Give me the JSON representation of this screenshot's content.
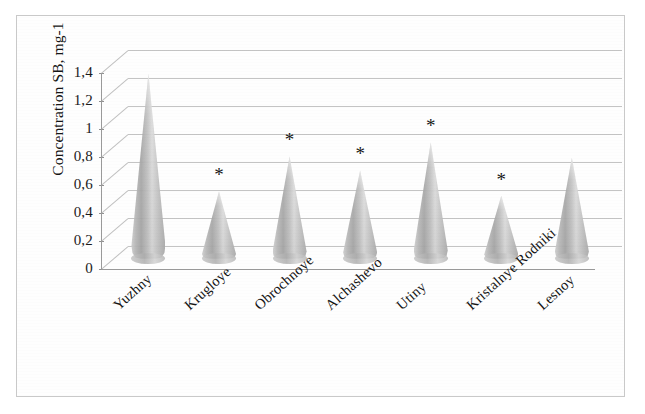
{
  "chart_data": {
    "type": "bar",
    "subtype": "3d-cone",
    "title": "",
    "xlabel": "",
    "ylabel": "Concentration SB, mg-1",
    "categories": [
      "Yuzhny",
      "Krugloye",
      "Obrochnoye",
      "Alchashevo",
      "Utiny",
      "Kristalnye Rodniki",
      "Lesnoy"
    ],
    "values": [
      1.32,
      0.48,
      0.73,
      0.63,
      0.83,
      0.45,
      0.72
    ],
    "annotations": [
      {
        "category": "Krugloye",
        "marker": "*"
      },
      {
        "category": "Obrochnoye",
        "marker": "*"
      },
      {
        "category": "Alchashevo",
        "marker": "*"
      },
      {
        "category": "Utiny",
        "marker": "*"
      },
      {
        "category": "Kristalnye Rodniki",
        "marker": "*"
      }
    ],
    "ylim": [
      0,
      1.4
    ],
    "ytick_labels": [
      "1,4",
      "1,2",
      "1",
      "0,8",
      "0,6",
      "0,4",
      "0,2",
      "0"
    ],
    "ytick_values": [
      1.4,
      1.2,
      1.0,
      0.8,
      0.6,
      0.4,
      0.2,
      0
    ],
    "grid": true,
    "legend": "none",
    "decimal_separator": ",",
    "colors": {
      "series_fill": "#bdbdbd",
      "grid": "#b8b8b8",
      "axis": "#9a9a9a",
      "text": "#151515",
      "frame": "#c9c9c9",
      "background": "#ffffff"
    }
  }
}
